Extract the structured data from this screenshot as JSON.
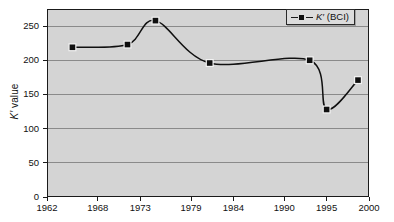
{
  "chart_data": {
    "type": "line",
    "title": "",
    "xlabel": "",
    "ylabel": "K′ value",
    "ylabel_symbol": "K′",
    "ylabel_rest": " value",
    "xlim": [
      1962,
      2000
    ],
    "ylim": [
      0,
      275
    ],
    "grid": true,
    "legend_position": "top-right",
    "x_ticks": [
      "1962",
      "1968",
      "1973",
      "1979",
      "1984",
      "1990",
      "1995",
      "2000"
    ],
    "y_ticks": [
      "0",
      "50",
      "100",
      "150",
      "200",
      "250"
    ],
    "series": [
      {
        "name": "K′ (BCI)",
        "name_symbol": "K′",
        "name_rest": " (BCI)",
        "marker": "square",
        "color": "#101010",
        "x": [
          1965.0,
          1971.5,
          1974.8,
          1981.2,
          1993.0,
          1995.0,
          1998.7
        ],
        "values": [
          219,
          223,
          258,
          196,
          200,
          128,
          171
        ]
      }
    ]
  },
  "legend": {
    "entry_symbol": "K′",
    "entry_rest": " (BCI)"
  },
  "colors": {
    "plot_background": "#d4d4d4",
    "gridline": "#8a8a8a",
    "axis": "#1a1a1a",
    "series": "#101010",
    "page_background": "#ffffff"
  }
}
